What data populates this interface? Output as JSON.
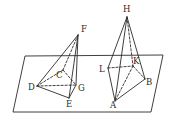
{
  "figure": {
    "plane": {
      "corners": [
        [
          25,
          56
        ],
        [
          163,
          55
        ],
        [
          151,
          112
        ],
        [
          13,
          112
        ]
      ]
    },
    "left_pyramid": {
      "apex": "F",
      "base": [
        "D",
        "C",
        "G",
        "E"
      ],
      "points": {
        "F": [
          78,
          35
        ],
        "D": [
          37,
          86
        ],
        "C": [
          63,
          70
        ],
        "G": [
          76,
          85
        ],
        "E": [
          69,
          98
        ]
      },
      "solid_edges": [
        [
          "F",
          "D"
        ],
        [
          "F",
          "G"
        ],
        [
          "F",
          "E"
        ],
        [
          "D",
          "E"
        ],
        [
          "E",
          "G"
        ]
      ],
      "hidden_edges": [
        [
          "F",
          "C"
        ],
        [
          "D",
          "C"
        ],
        [
          "C",
          "G"
        ],
        [
          "D",
          "G"
        ]
      ]
    },
    "right_pyramid": {
      "apex": "H",
      "base": [
        "L",
        "K",
        "B",
        "A"
      ],
      "points": {
        "H": [
          127,
          17
        ],
        "L": [
          108,
          68
        ],
        "K": [
          133,
          66
        ],
        "B": [
          145,
          79
        ],
        "A": [
          115,
          101
        ]
      },
      "solid_edges": [
        [
          "H",
          "L"
        ],
        [
          "H",
          "A"
        ],
        [
          "H",
          "B"
        ],
        [
          "L",
          "A"
        ],
        [
          "A",
          "B"
        ]
      ],
      "hidden_edges": [
        [
          "H",
          "K"
        ],
        [
          "L",
          "K"
        ],
        [
          "K",
          "B"
        ],
        [
          "K",
          "A"
        ]
      ]
    },
    "labels": [
      {
        "id": "F",
        "text": "F",
        "x": 81,
        "y": 32
      },
      {
        "id": "C",
        "text": "C",
        "x": 56,
        "y": 78
      },
      {
        "id": "D",
        "text": "D",
        "x": 28,
        "y": 90
      },
      {
        "id": "G",
        "text": "G",
        "x": 78,
        "y": 91
      },
      {
        "id": "E",
        "text": "E",
        "x": 66,
        "y": 107
      },
      {
        "id": "H",
        "text": "H",
        "x": 123,
        "y": 12
      },
      {
        "id": "L",
        "text": "L",
        "x": 99,
        "y": 72
      },
      {
        "id": "K",
        "text": "K",
        "x": 133,
        "y": 64
      },
      {
        "id": "B",
        "text": "B",
        "x": 146,
        "y": 85
      },
      {
        "id": "A",
        "text": "A",
        "x": 110,
        "y": 108
      }
    ]
  }
}
